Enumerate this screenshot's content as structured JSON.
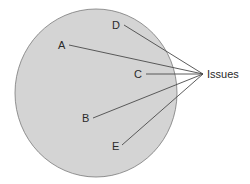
{
  "diagram": {
    "circle": {
      "cx": 96,
      "cy": 93,
      "rx": 81,
      "ry": 84,
      "fill": "#d4d4d4",
      "stroke": "#7a7a7a"
    },
    "target": {
      "label": "Issues",
      "x": 203,
      "y": 74,
      "label_x": 207,
      "label_y": 78
    },
    "points": [
      {
        "label": "A",
        "lx": 58,
        "ly": 49,
        "x": 69,
        "y": 45
      },
      {
        "label": "B",
        "lx": 82,
        "ly": 122,
        "x": 93,
        "y": 118
      },
      {
        "label": "C",
        "lx": 134,
        "ly": 78,
        "x": 146,
        "y": 74
      },
      {
        "label": "D",
        "lx": 112,
        "ly": 29,
        "x": 124,
        "y": 25
      },
      {
        "label": "E",
        "lx": 112,
        "ly": 150,
        "x": 122,
        "y": 145
      }
    ],
    "line_color": "#4a4a4a"
  }
}
